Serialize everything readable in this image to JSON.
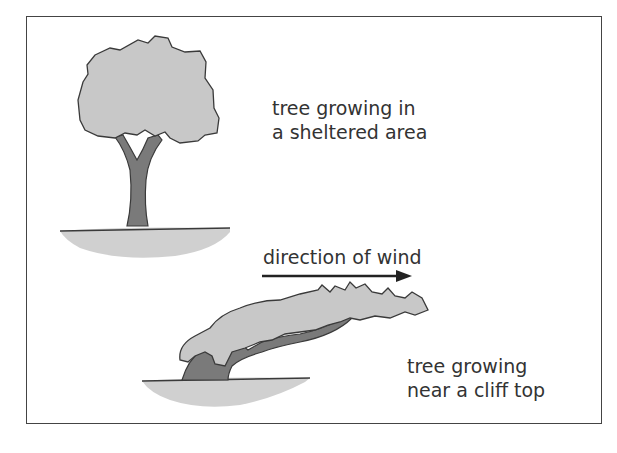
{
  "diagram": {
    "type": "illustration",
    "labels": {
      "sheltered": [
        "tree growing in",
        "a sheltered area"
      ],
      "wind": "direction of wind",
      "cliff": [
        "tree growing",
        "near a cliff top"
      ]
    },
    "colors": {
      "foliage": "#c8c8c8",
      "trunk": "#7a7a7a",
      "ground": "#d0d0d0",
      "outline": "#3a3a3a",
      "text": "#333333"
    }
  }
}
